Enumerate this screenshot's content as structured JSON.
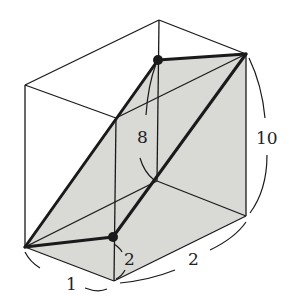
{
  "diagram": {
    "type": "3D box (rectangular prism) with shaded cross-section",
    "colors": {
      "line": "#1a1a1a",
      "shade": "#d9d9d6",
      "background": "#ffffff"
    },
    "labels": {
      "height_inner": "8",
      "height_outer": "10",
      "bottom_short": "1",
      "bottom_mid": "2",
      "bottom_long": "2"
    },
    "points": {
      "top_back": [
        159,
        20
      ],
      "top_left": [
        25,
        85
      ],
      "top_right": [
        246,
        54
      ],
      "top_front": [
        116,
        118
      ],
      "bottom_back": [
        157,
        181
      ],
      "bottom_left": [
        25,
        247
      ],
      "bottom_right": [
        246,
        216
      ],
      "bottom_front": [
        114,
        281
      ],
      "dot_top": [
        158,
        60
      ],
      "dot_bottom": [
        113,
        237
      ]
    }
  }
}
